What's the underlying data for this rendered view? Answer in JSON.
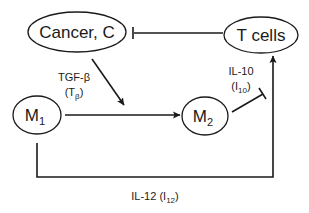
{
  "diagram": {
    "title": "",
    "nodes": [
      {
        "id": "cancer",
        "label": "Cancer, C"
      },
      {
        "id": "tcells",
        "label": "T cells"
      },
      {
        "id": "m1",
        "label": "M",
        "subscript": "1"
      },
      {
        "id": "m2",
        "label": "M",
        "subscript": "2"
      }
    ],
    "edges": [
      {
        "from": "tcells",
        "to": "cancer",
        "type": "inhibition",
        "label": ""
      },
      {
        "from": "cancer",
        "to": "m1_m2_edge",
        "type": "activation",
        "label": ""
      },
      {
        "from": "m1",
        "to": "m2",
        "type": "activation",
        "label": "TGF-β",
        "sublabel_main": "T",
        "sublabel_sub": "β"
      },
      {
        "from": "m2",
        "to": "tcells_edge",
        "type": "inhibition",
        "label": "IL-10",
        "sublabel_main": "I",
        "sublabel_sub": "10"
      },
      {
        "from": "m1",
        "to": "tcells",
        "type": "activation",
        "label": "IL-12",
        "sublabel_main": "I",
        "sublabel_sub": "12"
      }
    ]
  },
  "colors": {
    "stroke": "#1a1a1a",
    "background": "#ffffff"
  }
}
